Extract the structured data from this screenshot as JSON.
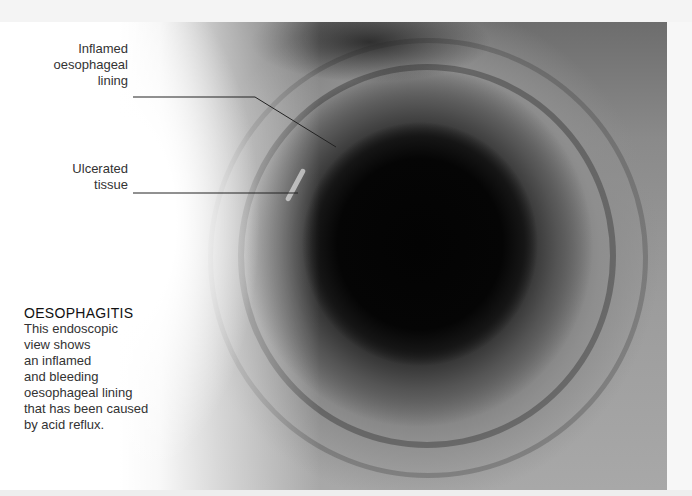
{
  "figure": {
    "type": "endoscopic-photograph",
    "colors": {
      "text": "#333333",
      "leader_line": "#222222",
      "background": "#ffffff"
    }
  },
  "labels": {
    "inflamed": {
      "lines": [
        "Inflamed",
        "oesophageal",
        "lining"
      ]
    },
    "ulcerated": {
      "lines": [
        "Ulcerated",
        "tissue"
      ]
    }
  },
  "caption": {
    "title": "OESOPHAGITIS",
    "lines": [
      "This endoscopic",
      "view shows",
      "an inflamed",
      "and bleeding",
      "oesophageal lining",
      "that has been caused",
      "by acid reflux."
    ]
  }
}
